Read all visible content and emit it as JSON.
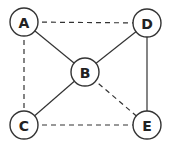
{
  "graph": {
    "nodes": [
      {
        "id": "A",
        "label": "A",
        "x": 24,
        "y": 22,
        "r": 14
      },
      {
        "id": "B",
        "label": "B",
        "x": 85,
        "y": 72,
        "r": 14
      },
      {
        "id": "C",
        "label": "C",
        "x": 24,
        "y": 125,
        "r": 14
      },
      {
        "id": "D",
        "label": "D",
        "x": 147,
        "y": 23,
        "r": 14
      },
      {
        "id": "E",
        "label": "E",
        "x": 147,
        "y": 125,
        "r": 14
      }
    ],
    "edges": [
      {
        "from": "A",
        "to": "D",
        "style": "dashed"
      },
      {
        "from": "A",
        "to": "C",
        "style": "dashed"
      },
      {
        "from": "A",
        "to": "B",
        "style": "solid"
      },
      {
        "from": "B",
        "to": "D",
        "style": "solid"
      },
      {
        "from": "B",
        "to": "C",
        "style": "solid"
      },
      {
        "from": "B",
        "to": "E",
        "style": "dashed"
      },
      {
        "from": "D",
        "to": "E",
        "style": "solid"
      },
      {
        "from": "C",
        "to": "E",
        "style": "dashed"
      }
    ]
  },
  "colors": {
    "stroke": "#333333",
    "label": "#222222",
    "background": "#ffffff"
  }
}
